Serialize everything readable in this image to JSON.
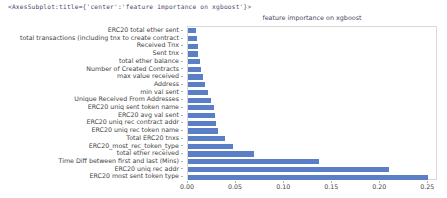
{
  "repr_line": "<AxesSubplot:title={'center':'feature importance on xgboost'}>",
  "chart_data": {
    "type": "bar",
    "orientation": "horizontal",
    "title": "feature importance on xgboost",
    "xlabel": "",
    "ylabel": "",
    "xlim": [
      0.0,
      0.26
    ],
    "xticks": [
      "0.00",
      "0.05",
      "0.10",
      "0.15",
      "0.20",
      "0.25"
    ],
    "xtick_values": [
      0.0,
      0.05,
      0.1,
      0.15,
      0.2,
      0.25
    ],
    "grid": false,
    "legend": false,
    "bar_color": "#5b7fc7",
    "categories": [
      "ERC20 total ether sent",
      "total transactions (including tnx to create contract",
      "Received Tnx",
      "Sent tnx",
      "total ether balance",
      "Number of Created Contracts",
      "max value received",
      "Address",
      "min val sent",
      "Unique Received From Addresses",
      "ERC20 uniq sent token name",
      "ERC20 avg val sent",
      "ERC20 uniq rec contract addr",
      "ERC20 uniq rec token name",
      "Total ERC20 tnxs",
      "ERC20_most_rec_token_type",
      "total ether received",
      "Time Diff between first and last (Mins)",
      "ERC20 uniq rec addr",
      "ERC20 most sent token type"
    ],
    "values": [
      0.008,
      0.009,
      0.01,
      0.01,
      0.012,
      0.013,
      0.016,
      0.018,
      0.021,
      0.024,
      0.027,
      0.028,
      0.029,
      0.031,
      0.038,
      0.047,
      0.069,
      0.136,
      0.209,
      0.25
    ]
  }
}
